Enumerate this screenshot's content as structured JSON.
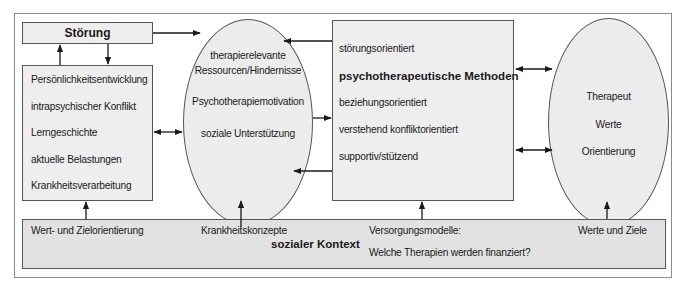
{
  "diagram": {
    "stoerung_box": {
      "label": "Störung"
    },
    "left_box": {
      "items": [
        "Persönlichkeitsentwicklung",
        "intrapsychischer Konflikt",
        "Lerngeschichte",
        "aktuelle Belastungen",
        "Krankheitsverarbeitung"
      ]
    },
    "left_ellipse": {
      "line1": "therapierelevante",
      "line2": "Ressourcen/Hindernisse",
      "line3": "Psychotherapiemotivation",
      "line4": "soziale Unterstützung"
    },
    "center_box": {
      "items": [
        "störungsorientiert",
        "psychotherapeutische Methoden",
        "beziehungsorientiert",
        "verstehend konfliktorientiert",
        "supportiv/stützend"
      ]
    },
    "right_ellipse": {
      "items": [
        "Therapeut",
        "Werte",
        "Orientierung"
      ]
    },
    "bottom_bar": {
      "title": "sozialer Kontext",
      "item1": "Wert- und Zielorientierung",
      "item2": "Krankheitskonzepte",
      "item3_line1": "Versorgungsmodelle:",
      "item3_line2": "Welche Therapien werden finanziert?",
      "item4": "Werte und Ziele"
    },
    "colors": {
      "box_fill": "#eeeeee",
      "bar_fill": "#e2e2e2",
      "stroke": "#555555",
      "arrow": "#1a1a1a"
    }
  }
}
